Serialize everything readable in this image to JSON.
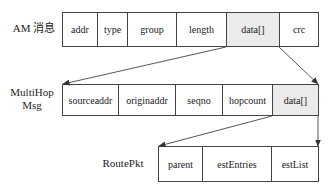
{
  "diagram": {
    "rows": [
      {
        "label": "AM 消息",
        "fields": [
          {
            "name": "addr",
            "shaded": false
          },
          {
            "name": "type",
            "shaded": false
          },
          {
            "name": "group",
            "shaded": false
          },
          {
            "name": "length",
            "shaded": false
          },
          {
            "name": "data[]",
            "shaded": true
          },
          {
            "name": "crc",
            "shaded": false
          }
        ]
      },
      {
        "label_line1": "MultiHop",
        "label_line2": "Msg",
        "fields": [
          {
            "name": "sourceaddr",
            "shaded": false
          },
          {
            "name": "originaddr",
            "shaded": false
          },
          {
            "name": "seqno",
            "shaded": false
          },
          {
            "name": "hopcount",
            "shaded": false
          },
          {
            "name": "data[]",
            "shaded": true
          }
        ]
      },
      {
        "label": "RoutePkt",
        "fields": [
          {
            "name": "parent",
            "shaded": false
          },
          {
            "name": "estEntries",
            "shaded": false
          },
          {
            "name": "estList",
            "shaded": false
          }
        ]
      }
    ],
    "arrows": [
      {
        "from": "AM 消息.data[] left-bottom",
        "to": "MultiHop Msg left-top"
      },
      {
        "from": "AM 消息.data[] right-bottom",
        "to": "MultiHop Msg right-top"
      },
      {
        "from": "MultiHop Msg.data[] left-bottom",
        "to": "RoutePkt left-top"
      },
      {
        "from": "MultiHop Msg.data[] right-bottom",
        "to": "RoutePkt right-top"
      }
    ],
    "colors": {
      "line": "#444444",
      "shaded_fill": "#ebebeb",
      "text": "#222222"
    }
  }
}
